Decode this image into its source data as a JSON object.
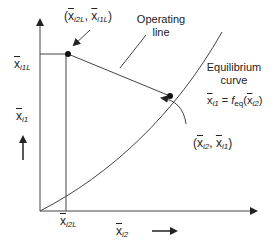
{
  "diagram": {
    "axes": {
      "x_label": {
        "base": "x",
        "sub": "i2"
      },
      "y_label": {
        "base": "x",
        "sub": "i1"
      },
      "x_tick": {
        "base": "x",
        "sub": "i2L"
      },
      "y_tick": {
        "base": "x",
        "sub": "i1L"
      }
    },
    "annotations": {
      "top_point": {
        "open": "(",
        "x_base": "x",
        "x_sub": "i2L",
        "sep": ", ",
        "y_base": "x",
        "y_sub": "i1L",
        "close": ")"
      },
      "operating_line_1": "Operating",
      "operating_line_2": "line",
      "equilibrium_1": "Equilibrium",
      "equilibrium_2": "curve",
      "equation": {
        "lhs_base": "x",
        "lhs_sub": "i1",
        "eq": " = ",
        "f": "f",
        "f_sub": "eq",
        "arg_open": "(",
        "arg_base": "x",
        "arg_sub": "i2",
        "arg_close": ")"
      },
      "end_point": {
        "open": "(",
        "x_base": "x",
        "x_sub": "i2",
        "sep": ", ",
        "y_base": "x",
        "y_sub": "i1",
        "close": ")"
      }
    },
    "colors": {
      "line": "#333333",
      "text": "#222222"
    }
  }
}
